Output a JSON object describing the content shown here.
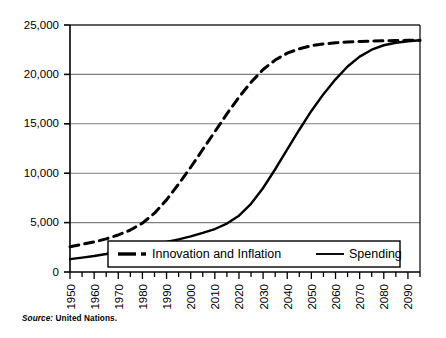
{
  "chart_data": {
    "type": "line",
    "title": "",
    "xlabel": "",
    "ylabel": "",
    "xlim": [
      1950,
      2095
    ],
    "ylim": [
      0,
      25000
    ],
    "grid": true,
    "grid_axis": "y",
    "legend_position": "bottom-center-inside",
    "x_tick_labels": [
      "1950",
      "1960",
      "1970",
      "1980",
      "1990",
      "2000",
      "2010",
      "2020",
      "2030",
      "2040",
      "2050",
      "2060",
      "2070",
      "2080",
      "2090"
    ],
    "x_tick_values": [
      1950,
      1960,
      1970,
      1980,
      1990,
      2000,
      2010,
      2020,
      2030,
      2040,
      2050,
      2060,
      2070,
      2080,
      2090
    ],
    "x_minor_tick_interval": 5,
    "y_tick_labels": [
      "0",
      "5,000",
      "10,000",
      "15,000",
      "20,000",
      "25,000"
    ],
    "y_tick_values": [
      0,
      5000,
      10000,
      15000,
      20000,
      25000
    ],
    "x": [
      1950,
      1955,
      1960,
      1965,
      1970,
      1975,
      1980,
      1985,
      1990,
      1995,
      2000,
      2005,
      2010,
      2015,
      2020,
      2025,
      2030,
      2035,
      2040,
      2045,
      2050,
      2055,
      2060,
      2065,
      2070,
      2075,
      2080,
      2085,
      2090,
      2095
    ],
    "series": [
      {
        "name": "Innovation and Inflation",
        "style": "dashed",
        "color": "#000000",
        "values": [
          2550,
          2800,
          3050,
          3350,
          3750,
          4250,
          4950,
          5950,
          7300,
          8900,
          10600,
          12400,
          14200,
          16000,
          17700,
          19200,
          20500,
          21450,
          22150,
          22600,
          22900,
          23080,
          23200,
          23280,
          23330,
          23370,
          23400,
          23430,
          23450,
          23460
        ]
      },
      {
        "name": "Spending",
        "style": "solid",
        "color": "#000000",
        "values": [
          1300,
          1450,
          1620,
          1820,
          2050,
          2300,
          2550,
          2800,
          3050,
          3300,
          3600,
          3950,
          4350,
          4900,
          5700,
          6900,
          8500,
          10400,
          12400,
          14400,
          16300,
          18000,
          19500,
          20800,
          21800,
          22500,
          22950,
          23200,
          23350,
          23450
        ]
      }
    ],
    "legend_entries": [
      {
        "label": "Innovation and Inflation",
        "style": "dash-dot"
      },
      {
        "label": "Spending",
        "style": "solid"
      }
    ]
  },
  "source": {
    "label": "Source:",
    "text": " United Nations."
  },
  "colors": {
    "axis": "#000000",
    "grid": "#808080",
    "plot_background": "#ffffff",
    "page_background": "#ffffff"
  }
}
